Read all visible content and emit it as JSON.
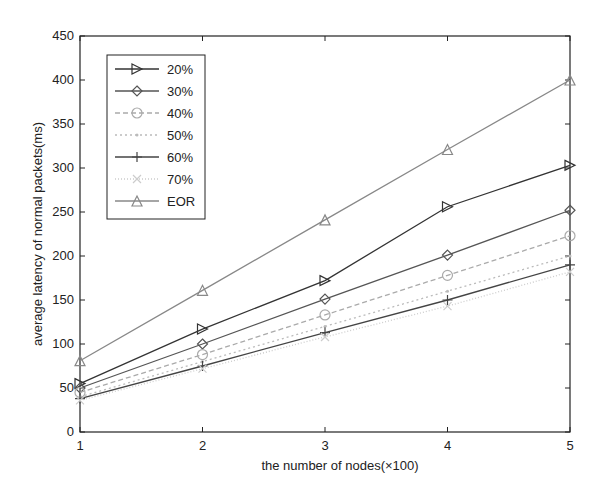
{
  "chart_data": {
    "type": "line",
    "title": "",
    "xlabel": "the number of nodes(×100)",
    "ylabel": "average latency of normal packets(ms)",
    "x": [
      1,
      2,
      3,
      4,
      5
    ],
    "xlim": [
      1,
      5
    ],
    "ylim": [
      0,
      450
    ],
    "xticks": [
      1,
      2,
      3,
      4,
      5
    ],
    "yticks": [
      0,
      50,
      100,
      150,
      200,
      250,
      300,
      350,
      400,
      450
    ],
    "grid": false,
    "legend_position": "upper left",
    "series": [
      {
        "name": "20%",
        "marker": "triangle-right",
        "color": "#333333",
        "dash": "",
        "values": [
          55,
          117,
          172,
          256,
          303
        ]
      },
      {
        "name": "30%",
        "marker": "diamond",
        "color": "#555555",
        "dash": "",
        "values": [
          50,
          100,
          151,
          201,
          252
        ]
      },
      {
        "name": "40%",
        "marker": "circle",
        "color": "#aaaaaa",
        "dash": "5,3",
        "values": [
          45,
          88,
          133,
          178,
          223
        ]
      },
      {
        "name": "50%",
        "marker": "dot",
        "color": "#bbbbbb",
        "dash": "2,3",
        "values": [
          40,
          80,
          120,
          160,
          200
        ]
      },
      {
        "name": "60%",
        "marker": "plus",
        "color": "#444444",
        "dash": "",
        "values": [
          38,
          75,
          113,
          150,
          190
        ]
      },
      {
        "name": "70%",
        "marker": "x",
        "color": "#cccccc",
        "dash": "1,2",
        "values": [
          36,
          72,
          108,
          143,
          182
        ]
      },
      {
        "name": "EOR",
        "marker": "triangle-up",
        "color": "#888888",
        "dash": "",
        "values": [
          81,
          161,
          241,
          321,
          400
        ]
      }
    ]
  }
}
